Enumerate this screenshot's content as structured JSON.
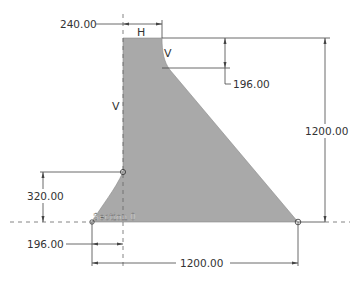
{
  "diagram": {
    "colors": {
      "section_fill": "#a9a9a9",
      "line": "#444444",
      "text": "#333333"
    },
    "labels": {
      "top_width_constraint": "H",
      "upstream_vertical_constraint": "V",
      "fillet_vertical_constraint": "V",
      "section_name": "Section 0"
    },
    "dimensions": {
      "top_width": "240.00",
      "fillet_height": "196.00",
      "total_height": "1200.00",
      "toe_height": "320.00",
      "toe_width": "196.00",
      "base_width": "1200.00"
    }
  }
}
